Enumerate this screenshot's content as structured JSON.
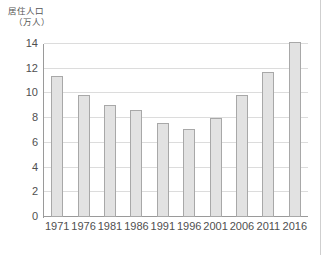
{
  "chart_data": {
    "type": "bar",
    "title": "",
    "ylabel_lines": [
      "居住人口",
      "（万人）"
    ],
    "ylabel": "居住人口（万人）",
    "xlabel": "",
    "categories": [
      "1971",
      "1976",
      "1981",
      "1986",
      "1991",
      "1996",
      "2001",
      "2006",
      "2011",
      "2016"
    ],
    "values": [
      11.4,
      9.85,
      9.05,
      8.65,
      7.6,
      7.15,
      8.0,
      9.9,
      11.7,
      14.2
    ],
    "yticks": [
      "0",
      "2",
      "4",
      "6",
      "8",
      "10",
      "12",
      "14"
    ],
    "ytick_values": [
      0,
      2,
      4,
      6,
      8,
      10,
      12,
      14
    ],
    "ylim": [
      0,
      14
    ],
    "grid": "horizontal",
    "legend": "none",
    "bar_color": "#e2e2e2",
    "bar_border_color": "#a8a8a8",
    "gridline_color": "#dcdcdc",
    "axis_color": "#9a9a9a"
  }
}
